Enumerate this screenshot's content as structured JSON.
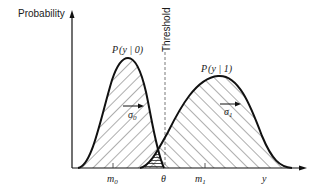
{
  "diagram": {
    "type": "overlapping-gaussian-distributions",
    "y_axis_label": "Probability",
    "x_axis_label": "y",
    "threshold_label": "Threshold",
    "threshold_symbol": "θ",
    "curves": [
      {
        "name": "P(y | 0)",
        "label_prefix": "P",
        "label_args": "(y | 0)",
        "mean_label": "m",
        "mean_sub": "0",
        "sigma_label": "σ",
        "sigma_sub": "0"
      },
      {
        "name": "P(y | 1)",
        "label_prefix": "P",
        "label_args": "(y | 1)",
        "mean_label": "m",
        "mean_sub": "1",
        "sigma_label": "σ",
        "sigma_sub": "1"
      }
    ],
    "colors": {
      "curve": "#111111",
      "hatch": "#333333",
      "axis": "#111111",
      "threshold": "#555555",
      "background": "#ffffff"
    }
  }
}
